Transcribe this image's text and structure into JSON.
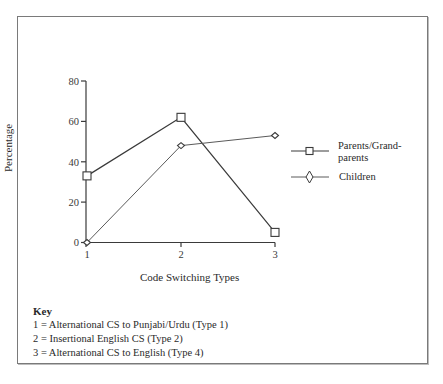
{
  "chart_data": {
    "type": "line",
    "title": "",
    "xlabel": "Code Switching Types",
    "ylabel": "Percentage",
    "x": [
      1,
      2,
      3
    ],
    "categories": [
      "1",
      "2",
      "3"
    ],
    "ylim": [
      0,
      80
    ],
    "yticks": [
      0,
      20,
      40,
      60,
      80
    ],
    "grid": false,
    "legend_position": "right",
    "series": [
      {
        "name": "Parents/Grand-parents",
        "marker": "square",
        "values": [
          33,
          62,
          5
        ]
      },
      {
        "name": "Children",
        "marker": "diamond",
        "values": [
          0,
          48,
          53
        ]
      }
    ],
    "key": {
      "title": "Key",
      "items": [
        "1 = Alternational CS to Punjabi/Urdu (Type 1)",
        "2 = Insertional English CS (Type 2)",
        "3 = Alternational CS to English (Type 4)"
      ]
    }
  },
  "labels": {
    "ylabel": "Percentage",
    "xlabel": "Code Switching Types",
    "yticks": [
      "0",
      "20",
      "40",
      "60",
      "80"
    ],
    "xticks": [
      "1",
      "2",
      "3"
    ],
    "legend_parents_line1": "Parents/Grand-",
    "legend_parents_line2": "parents",
    "legend_children": "Children",
    "key_title": "Key",
    "key_1": "1 = Alternational CS to Punjabi/Urdu (Type 1)",
    "key_2": "2 = Insertional English CS (Type 2)",
    "key_3": "3 = Alternational CS to English (Type 4)"
  },
  "colors": {
    "line": "#3a3a3a",
    "frame": "#7a7a7a"
  }
}
